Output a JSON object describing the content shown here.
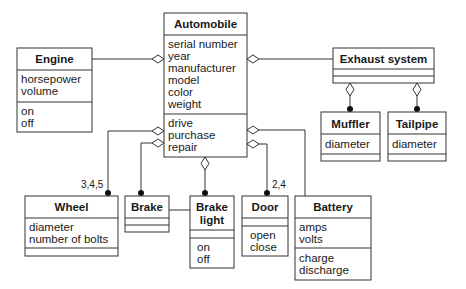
{
  "diagram": {
    "type": "UML class diagram",
    "classes": {
      "automobile": {
        "name": "Automobile",
        "attributes": [
          "serial number",
          "year",
          "manufacturer",
          "model",
          "color",
          "weight"
        ],
        "operations": [
          "drive",
          "purchase",
          "repair"
        ]
      },
      "engine": {
        "name": "Engine",
        "attributes": [
          "horsepower",
          "volume"
        ],
        "operations": [
          "on",
          "off"
        ]
      },
      "exhaust_system": {
        "name": "Exhaust system",
        "attributes": [],
        "operations": []
      },
      "muffler": {
        "name": "Muffler",
        "attributes": [
          "diameter"
        ],
        "operations": []
      },
      "tailpipe": {
        "name": "Tailpipe",
        "attributes": [
          "diameter"
        ],
        "operations": []
      },
      "wheel": {
        "name": "Wheel",
        "attributes": [
          "diameter",
          "number of bolts"
        ],
        "operations": []
      },
      "brake": {
        "name": "Brake",
        "attributes": [],
        "operations": []
      },
      "brake_light": {
        "name_lines": [
          "Brake",
          "light"
        ],
        "attributes": [],
        "operations": [
          "on",
          "off"
        ]
      },
      "door": {
        "name": "Door",
        "attributes": [],
        "operations": [
          "open",
          "close"
        ]
      },
      "battery": {
        "name": "Battery",
        "attributes": [
          "amps",
          "volts"
        ],
        "operations": [
          "charge",
          "discharge"
        ]
      }
    },
    "relationships": [
      {
        "from": "Engine",
        "to": "Automobile",
        "kind": "aggregation"
      },
      {
        "from": "Exhaust system",
        "to": "Automobile",
        "kind": "aggregation"
      },
      {
        "from": "Muffler",
        "to": "Exhaust system",
        "kind": "aggregation"
      },
      {
        "from": "Tailpipe",
        "to": "Exhaust system",
        "kind": "aggregation"
      },
      {
        "from": "Wheel",
        "to": "Automobile",
        "kind": "aggregation",
        "multiplicity": "3,4,5"
      },
      {
        "from": "Brake",
        "to": "Automobile",
        "kind": "aggregation"
      },
      {
        "from": "Brake light",
        "to": "Automobile",
        "kind": "aggregation"
      },
      {
        "from": "Door",
        "to": "Automobile",
        "kind": "aggregation",
        "multiplicity": "2,4"
      },
      {
        "from": "Battery",
        "to": "Automobile",
        "kind": "aggregation"
      },
      {
        "from": "Brake",
        "to": "Brake light",
        "kind": "association"
      }
    ],
    "multiplicities": {
      "wheel": "3,4,5",
      "door": "2,4"
    }
  }
}
